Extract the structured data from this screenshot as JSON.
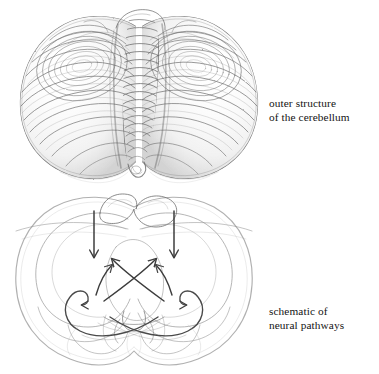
{
  "page": {
    "background_color": "#ffffff",
    "width": 379,
    "height": 374,
    "ink_color": "#555555",
    "text_color": "#141414"
  },
  "figures": [
    {
      "id": "outer-structure",
      "kind": "pencil-sketch",
      "subject": "cerebellum exterior view",
      "caption_lines": [
        "outer structure",
        "of the cerebellum"
      ]
    },
    {
      "id": "schematic",
      "kind": "line-drawing",
      "subject": "cerebellar neural pathways with arrows",
      "caption_lines": [
        "schematic of",
        "neural pathways"
      ]
    }
  ],
  "captions": {
    "outer_structure": {
      "line1": "outer structure",
      "line2": "of the cerebellum"
    },
    "schematic": {
      "line1": "schematic of",
      "line2": "neural pathways"
    }
  }
}
